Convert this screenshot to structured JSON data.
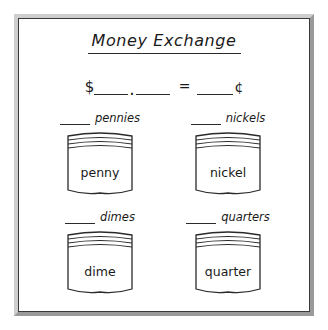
{
  "worksheet": {
    "title": "Money Exchange",
    "equation": {
      "dollar_symbol": "$",
      "dollars_blank": "",
      "decimal_point": ".",
      "cents_blank": "",
      "equals_symbol": "=",
      "total_cents_blank": "",
      "cent_symbol": "¢"
    },
    "coins": [
      {
        "blank": "",
        "label": "pennies",
        "bag_text": "penny",
        "name": "penny"
      },
      {
        "blank": "",
        "label": "nickels",
        "bag_text": "nickel",
        "name": "nickel"
      },
      {
        "blank": "",
        "label": "dimes",
        "bag_text": "dime",
        "name": "dime"
      },
      {
        "blank": "",
        "label": "quarters",
        "bag_text": "quarter",
        "name": "quarter"
      }
    ]
  },
  "colors": {
    "ink": "#1a1a1a",
    "line": "#2a2a2a",
    "frame_outer": "#b9b9b9",
    "frame_inner": "#3a3a3a",
    "paper": "#ffffff"
  }
}
